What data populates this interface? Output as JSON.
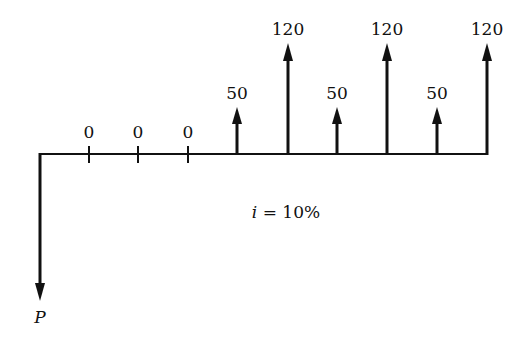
{
  "diagram": {
    "type": "cash-flow-diagram",
    "interest_label": "i = 10%",
    "interest_rate": "10%",
    "present_value_label": "P",
    "periods": [
      {
        "period": 1,
        "label": "0",
        "amount": 0
      },
      {
        "period": 2,
        "label": "0",
        "amount": 0
      },
      {
        "period": 3,
        "label": "0",
        "amount": 0
      },
      {
        "period": 4,
        "label": "50",
        "amount": 50
      },
      {
        "period": 5,
        "label": "120",
        "amount": 120
      },
      {
        "period": 6,
        "label": "50",
        "amount": 50
      },
      {
        "period": 7,
        "label": "120",
        "amount": 120
      },
      {
        "period": 8,
        "label": "50",
        "amount": 50
      },
      {
        "period": 9,
        "label": "120",
        "amount": 120
      }
    ]
  }
}
